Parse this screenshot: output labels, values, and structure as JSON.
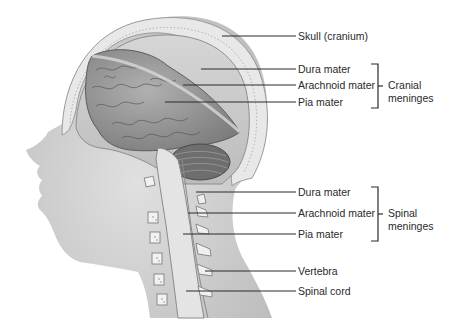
{
  "diagram": {
    "labels": {
      "skull": "Skull (cranium)",
      "cranial_dura": "Dura mater",
      "cranial_arachnoid": "Arachnoid mater",
      "cranial_pia": "Pia mater",
      "spinal_dura": "Dura mater",
      "spinal_arachnoid": "Arachnoid mater",
      "spinal_pia": "Pia mater",
      "vertebra": "Vertebra",
      "spinal_cord": "Spinal cord"
    },
    "groups": {
      "cranial": {
        "line1": "Cranial",
        "line2": "meninges"
      },
      "spinal": {
        "line1": "Spinal",
        "line2": "meninges"
      }
    },
    "colors": {
      "line": "#2a2a2a",
      "skin": "#d4d4d4",
      "skull": "#e6e6e6",
      "brain": "#9a9a9a",
      "dura": "#c8c8c8",
      "cerebellum": "#707070",
      "spinal_cord": "#e2e2e2"
    }
  }
}
